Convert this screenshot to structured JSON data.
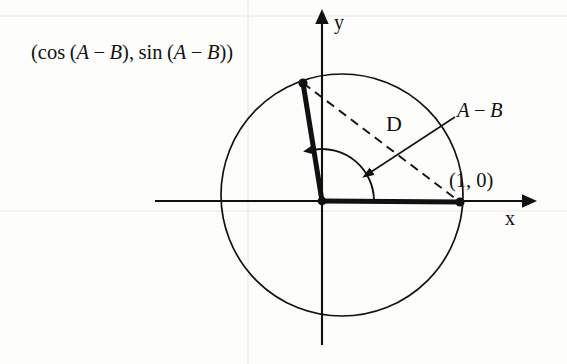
{
  "figure": {
    "stroke_color": "#111111",
    "background_color": "#fdfdfb",
    "gridline_color": "#e6e6e2"
  },
  "labels": {
    "point_coords": {
      "open_paren": "(",
      "cos": "cos",
      "inner_open": "(",
      "var_a": "A",
      "minus": "−",
      "var_b": "B",
      "inner_close": ")",
      "comma": ",",
      "sin": "sin",
      "close_paren": ")"
    },
    "axis_y": "y",
    "axis_x": "x",
    "distance": "D",
    "angle": {
      "var_a": "A",
      "minus": "−",
      "var_b": "B"
    },
    "point_one_zero": "(1, 0)"
  },
  "geometry": {
    "origin": {
      "x": 322,
      "y": 201
    },
    "circle": {
      "cx": 342,
      "cy": 195,
      "r": 121
    },
    "terminal_point": {
      "x": 303,
      "y": 83
    },
    "unit_point": {
      "x": 460,
      "y": 202
    },
    "x_axis": {
      "x1": 155,
      "y1": 201,
      "x2": 528,
      "y2": 201
    },
    "y_axis": {
      "x1": 322,
      "y1": 18,
      "x2": 322,
      "y2": 345
    },
    "arc_radius": 52,
    "angle_start_deg": 0,
    "angle_end_deg": 99
  }
}
